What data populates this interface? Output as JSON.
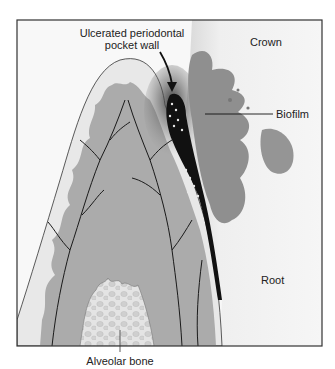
{
  "figure": {
    "type": "anatomical cross-section illustration",
    "colors": {
      "frame": "#333333",
      "gingiva_light": "#e6e6e6",
      "gingiva_mid": "#b4b4b4",
      "connective_tissue": "#a6a6a6",
      "tooth": "#f2f2f2",
      "biofilm": "#8e8e8e",
      "pocket": "#111111",
      "bone": "#dcdcdc",
      "vessels": "#1a1a1a"
    }
  },
  "labels": {
    "pocket_wall": "Ulcerated periodontal pocket wall",
    "pocket_wall_line1": "Ulcerated periodontal",
    "pocket_wall_line2": "pocket wall",
    "crown": "Crown",
    "biofilm": "Biofilm",
    "root": "Root",
    "alveolar_bone": "Alveolar bone"
  }
}
